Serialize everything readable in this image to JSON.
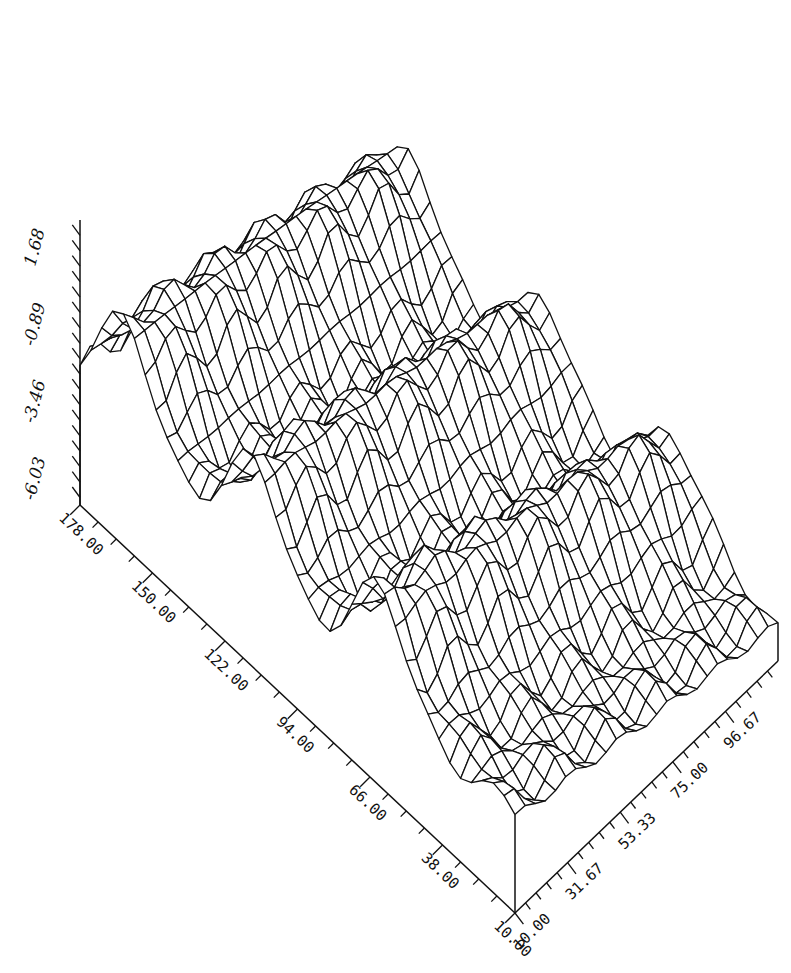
{
  "chart_data": {
    "type": "surface",
    "title": "",
    "xlabel": "",
    "ylabel": "",
    "zlabel": "",
    "x_axis": {
      "range": [
        10.0,
        118.33
      ],
      "tick_labels": [
        "10.00",
        "31.67",
        "53.33",
        "75.00",
        "96.67"
      ],
      "tick_values": [
        10.0,
        31.67,
        53.33,
        75.0,
        96.67
      ],
      "minor_ticks_per_major": 4
    },
    "y_axis": {
      "range": [
        10.0,
        178.0
      ],
      "tick_labels": [
        "10.00",
        "38.00",
        "66.00",
        "94.00",
        "122.00",
        "150.00",
        "178.00"
      ],
      "tick_values": [
        10.0,
        38.0,
        66.0,
        94.0,
        122.0,
        150.0,
        178.0
      ],
      "minor_ticks_per_major": 3
    },
    "z_axis": {
      "range": [
        -7.0,
        2.5
      ],
      "tick_labels": [
        "-6.03",
        "-3.46",
        "-0.89",
        "1.68"
      ],
      "tick_values": [
        -6.03,
        -3.46,
        -0.89,
        1.68
      ],
      "minor_ticks_per_major": 4
    },
    "grid": false,
    "style": "wireframe",
    "surface": {
      "nx": 26,
      "ny": 40,
      "base_level": -6.03,
      "description": "Undulating ridge-and-trough surface; three diagonal ridges running along x with dips near y≈66, y≈122, y≈150",
      "ridges": [
        {
          "y_center": 160.0,
          "amplitude": 4.2,
          "width": 18.0
        },
        {
          "y_center": 110.0,
          "amplitude": 3.6,
          "width": 16.0
        },
        {
          "y_center": 62.0,
          "amplitude": 3.2,
          "width": 15.0
        }
      ],
      "x_slope": -0.018,
      "ripple_amplitude": 0.55
    }
  }
}
